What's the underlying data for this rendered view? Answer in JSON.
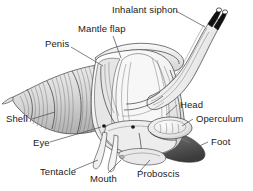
{
  "figure": {
    "background_color": "#ffffff",
    "line_color": "#3a3a3a",
    "label_color": "#1a1a1a",
    "width": 253,
    "height": 191
  },
  "labels": [
    {
      "id": "inhalant-siphon",
      "text": "Inhalant siphon",
      "x": 112,
      "y": 13,
      "anchor": "start"
    },
    {
      "id": "mantle-flap",
      "text": "Mantle flap",
      "x": 78,
      "y": 32,
      "anchor": "start"
    },
    {
      "id": "penis",
      "text": "Penis",
      "x": 45,
      "y": 47,
      "anchor": "start"
    },
    {
      "id": "shell",
      "text": "Shell",
      "x": 6,
      "y": 122,
      "anchor": "start"
    },
    {
      "id": "eye",
      "text": "Eye",
      "x": 33,
      "y": 146,
      "anchor": "start"
    },
    {
      "id": "tentacle",
      "text": "Tentacle",
      "x": 40,
      "y": 175,
      "anchor": "start"
    },
    {
      "id": "mouth",
      "text": "Mouth",
      "x": 90,
      "y": 182,
      "anchor": "start"
    },
    {
      "id": "proboscis",
      "text": "Proboscis",
      "x": 137,
      "y": 177,
      "anchor": "start"
    },
    {
      "id": "head",
      "text": "Head",
      "x": 180,
      "y": 108,
      "anchor": "start"
    },
    {
      "id": "operculum",
      "text": "Operculum",
      "x": 196,
      "y": 122,
      "anchor": "start"
    },
    {
      "id": "foot",
      "text": "Foot",
      "x": 211,
      "y": 145,
      "anchor": "start"
    }
  ],
  "parts": [
    {
      "id": "shell",
      "name": "Shell",
      "description": "spiral conical shell with fine hatching, pointed apex at left"
    },
    {
      "id": "mantle-flap",
      "name": "Mantle flap",
      "description": "folded flap over the upper body"
    },
    {
      "id": "penis",
      "name": "Penis",
      "description": "curved organ on the left of the body mass"
    },
    {
      "id": "inhalant-siphon",
      "name": "Inhalant siphon",
      "description": "long tube extending to upper right with two dark tips"
    },
    {
      "id": "head",
      "name": "Head",
      "description": "front region bearing eyes and tentacles"
    },
    {
      "id": "operculum",
      "name": "Operculum",
      "description": "oval horny plate on the rear of the foot"
    },
    {
      "id": "foot",
      "name": "Foot",
      "description": "dark muscular foot extending to the lower right"
    },
    {
      "id": "eye",
      "name": "Eye",
      "description": "two small dark dots on the head"
    },
    {
      "id": "tentacle",
      "name": "Tentacle",
      "description": "pair of slender projections below the head"
    },
    {
      "id": "mouth",
      "name": "Mouth",
      "description": "opening at the base of the proboscis"
    },
    {
      "id": "proboscis",
      "name": "Proboscis",
      "description": "extensible feeding tube at the front"
    }
  ]
}
